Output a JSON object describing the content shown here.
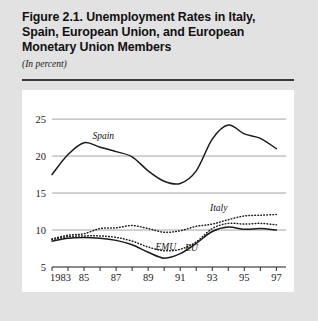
{
  "figure": {
    "title": "Figure 2.1.  Unemployment Rates in Italy, Spain, European Union, and European Monetary Union Members",
    "title_line1": "Figure 2.1.  Unemployment Rates in Italy,",
    "title_line2": "Spain, European Union, and European",
    "title_line3": "Monetary Union Members",
    "subtitle": "(In percent)"
  },
  "chart_data": {
    "type": "line",
    "title": "Figure 2.1.  Unemployment Rates in Italy, Spain, European Union, and European Monetary Union Members",
    "subtitle": "(In percent)",
    "xlabel": "",
    "ylabel": "",
    "ylim": [
      5,
      26.5
    ],
    "xlim": [
      1983,
      1997.6
    ],
    "yticks": [
      5,
      10,
      15,
      20,
      25
    ],
    "ytick_labels": [
      "5",
      "10",
      "15",
      "20",
      "25"
    ],
    "xticks": [
      1983,
      1984,
      1985,
      1986,
      1987,
      1988,
      1989,
      1990,
      1991,
      1992,
      1993,
      1994,
      1995,
      1996,
      1997
    ],
    "xtick_labels": [
      "1983",
      "",
      "85",
      "",
      "87",
      "",
      "89",
      "",
      "91",
      "",
      "93",
      "",
      "95",
      "",
      "97"
    ],
    "grid": "horizontal",
    "legend": "inline-annotations",
    "x": [
      1983,
      1984,
      1985,
      1986,
      1987,
      1988,
      1989,
      1990,
      1991,
      1992,
      1993,
      1994,
      1995,
      1996,
      1997
    ],
    "series": [
      {
        "name": "Spain",
        "style": "solid",
        "color": "#1a1a1a",
        "label_x": 1986.2,
        "label_y": 22.3,
        "values": [
          17.5,
          20.2,
          21.8,
          21.2,
          20.6,
          19.9,
          18.0,
          16.6,
          16.3,
          18.0,
          22.3,
          24.2,
          23.0,
          22.4,
          21.0
        ]
      },
      {
        "name": "Italy",
        "style": "dotted",
        "color": "#1a1a1a",
        "label_x": 1993.4,
        "label_y": 12.6,
        "values": [
          8.8,
          9.3,
          9.5,
          10.2,
          10.3,
          10.6,
          10.2,
          9.7,
          9.9,
          10.5,
          10.8,
          11.4,
          11.9,
          12.0,
          12.1
        ]
      },
      {
        "name": "EMU",
        "style": "dotted",
        "color": "#1a1a1a",
        "label_x": 1990.1,
        "label_y": 7.3,
        "values": [
          8.7,
          9.1,
          9.2,
          9.2,
          9.0,
          8.5,
          7.7,
          7.2,
          7.4,
          8.4,
          10.2,
          10.9,
          10.8,
          10.9,
          10.7
        ]
      },
      {
        "name": "EU",
        "style": "solid",
        "color": "#1a1a1a",
        "label_x": 1991.7,
        "label_y": 7.2,
        "values": [
          8.5,
          8.9,
          9.0,
          8.9,
          8.6,
          8.0,
          7.0,
          6.2,
          6.8,
          8.2,
          9.8,
          10.4,
          10.1,
          10.2,
          10.0
        ]
      }
    ],
    "annotations": [
      {
        "text": "Spain",
        "x": 1986.2,
        "y": 22.3
      },
      {
        "text": "Italy",
        "x": 1993.4,
        "y": 12.6
      },
      {
        "text": "EMU",
        "x": 1990.1,
        "y": 7.3
      },
      {
        "text": "EU",
        "x": 1991.7,
        "y": 7.2
      }
    ]
  },
  "colors": {
    "page_background": "#e2e2e2",
    "panel_background": "#ffffff",
    "line": "#1a1a1a",
    "gridline": "#9a9a9a",
    "rule": "#3a3a3a",
    "text": "#111111"
  }
}
